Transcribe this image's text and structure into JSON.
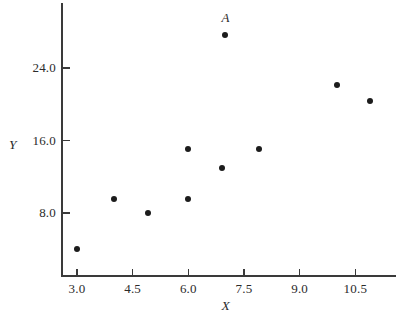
{
  "chart_data": {
    "type": "scatter",
    "title": "",
    "xlabel": "X",
    "ylabel": "Y",
    "xlim": [
      2.4,
      11.6
    ],
    "ylim": [
      2.4,
      30.0
    ],
    "grid": false,
    "legend": null,
    "xticks": [
      "3.0",
      "4.5",
      "6.0",
      "7.5",
      "9.0",
      "10.5"
    ],
    "xtick_values": [
      3.0,
      4.5,
      6.0,
      7.5,
      9.0,
      10.5
    ],
    "yticks": [
      "8.0",
      "16.0",
      "24.0"
    ],
    "ytick_values": [
      8.0,
      16.0,
      24.0
    ],
    "marker": "filled-circle",
    "marker_color": "#1c1c1c",
    "axis_color": "#3a3a3a",
    "points": [
      {
        "x": 3.0,
        "y": 4.0,
        "label": ""
      },
      {
        "x": 4.0,
        "y": 9.6,
        "label": ""
      },
      {
        "x": 4.9,
        "y": 8.0,
        "label": ""
      },
      {
        "x": 6.0,
        "y": 9.6,
        "label": ""
      },
      {
        "x": 6.0,
        "y": 15.1,
        "label": ""
      },
      {
        "x": 6.9,
        "y": 13.0,
        "label": ""
      },
      {
        "x": 7.0,
        "y": 27.6,
        "label": "A"
      },
      {
        "x": 7.9,
        "y": 15.1,
        "label": ""
      },
      {
        "x": 10.0,
        "y": 22.1,
        "label": ""
      },
      {
        "x": 10.9,
        "y": 20.4,
        "label": ""
      }
    ],
    "annotations": [
      {
        "text": "A",
        "x": 7.0,
        "y": 27.6,
        "position": "above"
      }
    ]
  }
}
